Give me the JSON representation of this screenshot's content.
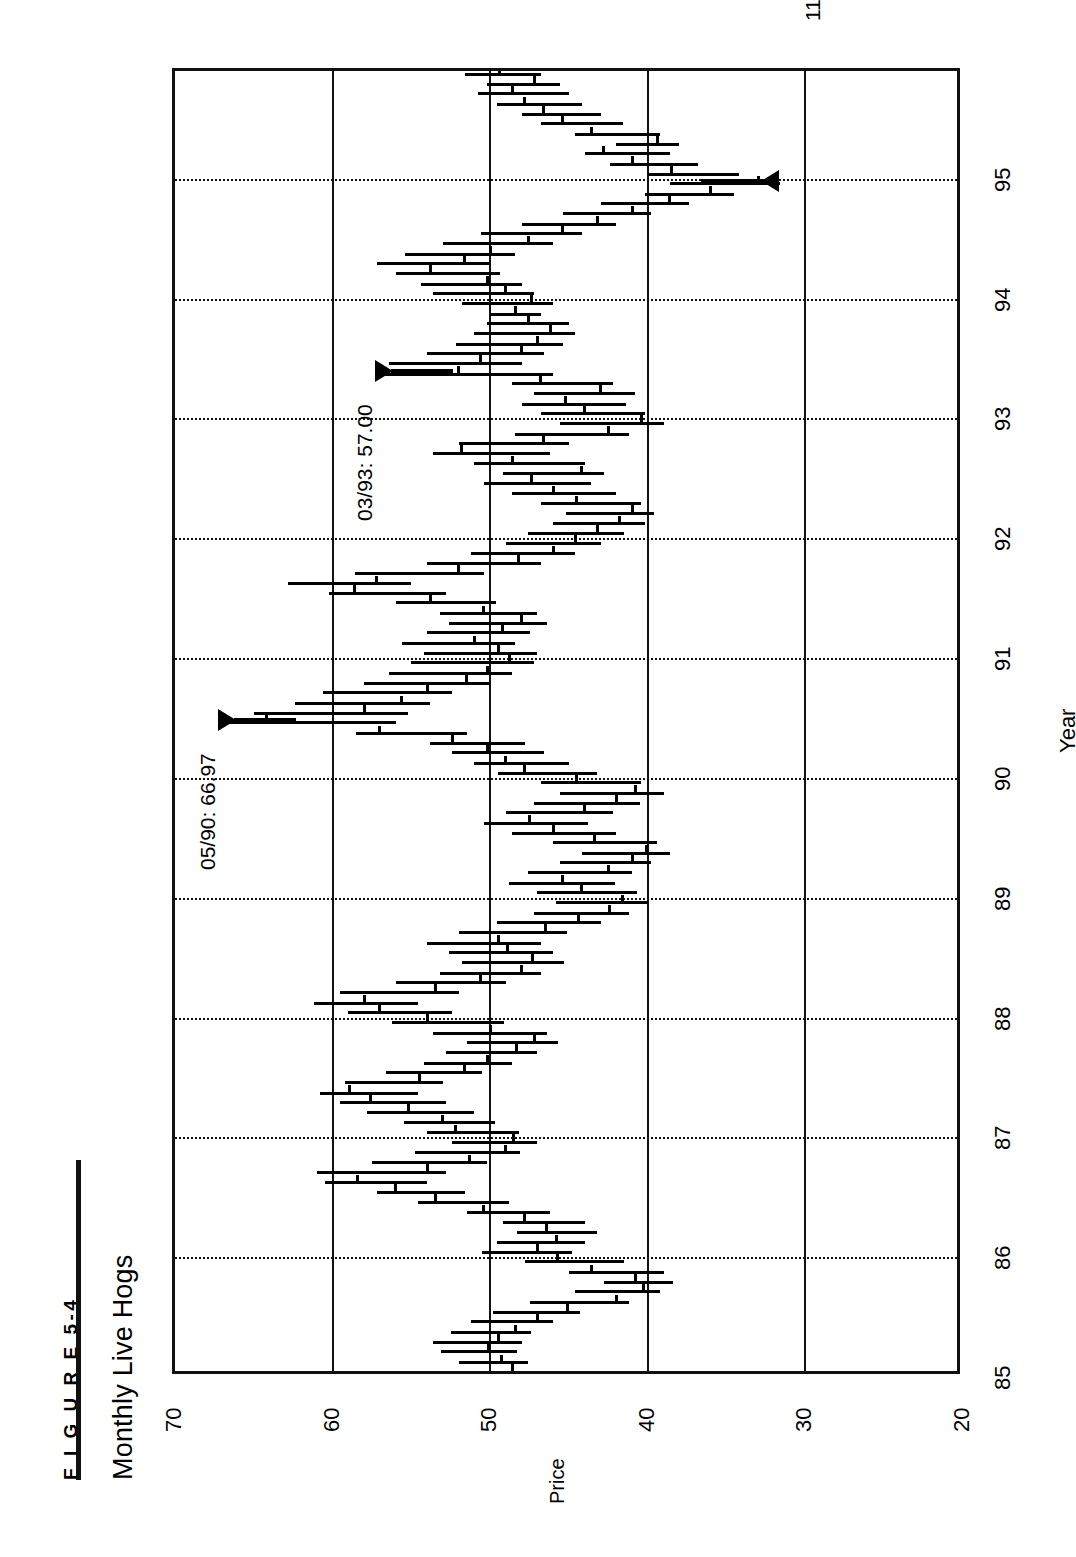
{
  "figure": {
    "label": "F I G U R E   5-4",
    "title": "Monthly Live Hogs"
  },
  "axes": {
    "price_axis_title": "Price",
    "year_axis_title": "Year",
    "price_ticks": [
      "70",
      "60",
      "50",
      "40",
      "30",
      "20"
    ],
    "price_min": 20,
    "price_max": 70,
    "year_ticks": [
      "85",
      "86",
      "87",
      "88",
      "89",
      "90",
      "91",
      "92",
      "93",
      "94",
      "95"
    ],
    "year_min": 1985.0,
    "year_max": 1995.9,
    "price_gridlines": [
      60,
      50,
      40,
      30
    ],
    "orientation": "rotated-90-cw"
  },
  "annotations": [
    {
      "name": "peak-1990",
      "label": "05/90: 66.97",
      "date": "05/90",
      "value": 66.97
    },
    {
      "name": "high-1993",
      "label": "03/93: 57.00",
      "date": "03/93",
      "value": 57.0
    },
    {
      "name": "low-1994",
      "label": "11/94: 31.60",
      "date": "11/94",
      "value": 31.6
    }
  ],
  "colors": {
    "ink": "#111111",
    "bar": "#000000",
    "background": "#ffffff"
  },
  "chart_data": {
    "type": "ohlc",
    "title": "Monthly Live Hogs",
    "xlabel": "Year",
    "ylabel": "Price",
    "xlim": [
      1985.0,
      1995.92
    ],
    "ylim": [
      20,
      70
    ],
    "grid": true,
    "legend": "none",
    "note": "Monthly high-low-close bars. Each entry: [decimal_year, high, low, close].",
    "columns": [
      "t",
      "high",
      "low",
      "close"
    ],
    "bars": [
      [
        1985.04,
        51.0,
        47.2,
        48.6
      ],
      [
        1985.12,
        52.0,
        47.6,
        49.3
      ],
      [
        1985.21,
        53.1,
        48.3,
        50.1
      ],
      [
        1985.29,
        53.6,
        48.0,
        49.5
      ],
      [
        1985.37,
        52.5,
        47.4,
        48.4
      ],
      [
        1985.46,
        51.2,
        46.0,
        47.0
      ],
      [
        1985.54,
        49.8,
        44.3,
        45.1
      ],
      [
        1985.62,
        47.5,
        41.2,
        42.0
      ],
      [
        1985.71,
        44.6,
        39.2,
        40.3
      ],
      [
        1985.79,
        42.8,
        38.4,
        40.8
      ],
      [
        1985.87,
        45.0,
        39.0,
        43.6
      ],
      [
        1985.96,
        47.8,
        41.5,
        45.7
      ],
      [
        1986.04,
        50.5,
        44.8,
        47.0
      ],
      [
        1986.12,
        49.6,
        44.0,
        45.8
      ],
      [
        1986.21,
        48.3,
        43.2,
        46.4
      ],
      [
        1986.29,
        49.2,
        44.0,
        47.8
      ],
      [
        1986.37,
        51.5,
        46.2,
        50.4
      ],
      [
        1986.46,
        54.6,
        48.8,
        53.5
      ],
      [
        1986.54,
        57.2,
        51.6,
        56.0
      ],
      [
        1986.62,
        60.5,
        54.0,
        58.4
      ],
      [
        1986.71,
        61.0,
        52.8,
        54.0
      ],
      [
        1986.79,
        57.5,
        50.2,
        51.3
      ],
      [
        1986.87,
        54.8,
        48.1,
        49.0
      ],
      [
        1986.96,
        52.4,
        47.0,
        48.5
      ],
      [
        1987.04,
        54.0,
        48.2,
        52.2
      ],
      [
        1987.12,
        55.5,
        49.7,
        53.0
      ],
      [
        1987.21,
        57.8,
        51.0,
        55.2
      ],
      [
        1987.29,
        59.5,
        52.8,
        57.6
      ],
      [
        1987.37,
        60.8,
        54.6,
        58.9
      ],
      [
        1987.46,
        59.2,
        53.0,
        54.5
      ],
      [
        1987.54,
        56.6,
        50.5,
        51.6
      ],
      [
        1987.62,
        54.2,
        48.6,
        50.2
      ],
      [
        1987.71,
        52.8,
        47.0,
        48.3
      ],
      [
        1987.79,
        51.5,
        45.7,
        47.2
      ],
      [
        1987.87,
        53.6,
        46.4,
        50.0
      ],
      [
        1987.96,
        56.2,
        49.1,
        54.0
      ],
      [
        1988.04,
        59.0,
        52.4,
        57.0
      ],
      [
        1988.12,
        61.2,
        54.6,
        58.0
      ],
      [
        1988.21,
        59.5,
        52.0,
        53.5
      ],
      [
        1988.29,
        56.0,
        49.0,
        50.6
      ],
      [
        1988.37,
        53.2,
        46.8,
        48.0
      ],
      [
        1988.46,
        51.8,
        45.3,
        47.3
      ],
      [
        1988.54,
        52.6,
        46.0,
        48.9
      ],
      [
        1988.62,
        54.0,
        46.8,
        49.5
      ],
      [
        1988.71,
        52.0,
        45.1,
        46.5
      ],
      [
        1988.79,
        49.6,
        43.0,
        44.4
      ],
      [
        1988.87,
        47.2,
        41.2,
        42.4
      ],
      [
        1988.96,
        45.8,
        40.0,
        41.6
      ],
      [
        1989.04,
        47.0,
        40.7,
        44.2
      ],
      [
        1989.12,
        48.8,
        42.1,
        45.4
      ],
      [
        1989.21,
        47.6,
        41.0,
        42.5
      ],
      [
        1989.29,
        45.6,
        39.8,
        41.0
      ],
      [
        1989.37,
        44.2,
        38.6,
        40.1
      ],
      [
        1989.46,
        46.0,
        39.4,
        43.4
      ],
      [
        1989.54,
        48.6,
        42.0,
        46.0
      ],
      [
        1989.62,
        50.4,
        43.8,
        47.5
      ],
      [
        1989.71,
        49.0,
        42.2,
        44.0
      ],
      [
        1989.79,
        47.2,
        40.5,
        42.0
      ],
      [
        1989.87,
        45.6,
        39.0,
        40.8
      ],
      [
        1989.96,
        46.8,
        40.4,
        44.5
      ],
      [
        1990.04,
        49.5,
        43.2,
        47.8
      ],
      [
        1990.12,
        51.0,
        45.0,
        49.0
      ],
      [
        1990.21,
        52.4,
        46.6,
        50.2
      ],
      [
        1990.29,
        53.8,
        47.8,
        52.4
      ],
      [
        1990.37,
        58.5,
        51.5,
        57.0
      ],
      [
        1990.46,
        66.97,
        56.0,
        64.2
      ],
      [
        1990.54,
        65.0,
        55.2,
        58.0
      ],
      [
        1990.62,
        62.4,
        53.8,
        55.6
      ],
      [
        1990.71,
        60.6,
        52.4,
        54.0
      ],
      [
        1990.79,
        58.0,
        50.0,
        51.5
      ],
      [
        1990.87,
        56.4,
        48.6,
        50.2
      ],
      [
        1990.96,
        55.0,
        47.2,
        48.8
      ],
      [
        1991.04,
        54.2,
        47.0,
        49.5
      ],
      [
        1991.12,
        55.6,
        48.4,
        51.0
      ],
      [
        1991.21,
        54.0,
        47.5,
        49.2
      ],
      [
        1991.29,
        52.6,
        46.4,
        48.0
      ],
      [
        1991.37,
        53.2,
        47.0,
        50.4
      ],
      [
        1991.46,
        56.0,
        49.6,
        53.8
      ],
      [
        1991.54,
        60.2,
        52.8,
        58.6
      ],
      [
        1991.62,
        62.8,
        55.0,
        57.2
      ],
      [
        1991.71,
        58.6,
        50.4,
        52.0
      ],
      [
        1991.79,
        54.0,
        46.8,
        48.2
      ],
      [
        1991.87,
        51.2,
        44.6,
        46.0
      ],
      [
        1991.96,
        49.0,
        43.0,
        44.6
      ],
      [
        1992.04,
        47.6,
        41.5,
        43.2
      ],
      [
        1992.12,
        46.0,
        40.2,
        41.8
      ],
      [
        1992.21,
        45.2,
        39.6,
        41.0
      ],
      [
        1992.29,
        46.8,
        40.4,
        44.5
      ],
      [
        1992.37,
        48.6,
        42.0,
        46.0
      ],
      [
        1992.46,
        50.4,
        43.6,
        47.4
      ],
      [
        1992.54,
        49.2,
        42.8,
        44.2
      ],
      [
        1992.62,
        51.0,
        44.0,
        48.6
      ],
      [
        1992.71,
        53.6,
        46.2,
        51.8
      ],
      [
        1992.79,
        52.0,
        45.0,
        46.6
      ],
      [
        1992.87,
        48.4,
        41.2,
        42.5
      ],
      [
        1992.96,
        45.6,
        39.0,
        40.4
      ],
      [
        1993.04,
        46.8,
        40.2,
        44.0
      ],
      [
        1993.12,
        48.0,
        41.4,
        45.2
      ],
      [
        1993.21,
        47.2,
        40.8,
        43.0
      ],
      [
        1993.29,
        48.6,
        42.2,
        46.8
      ],
      [
        1993.37,
        57.0,
        46.0,
        52.0
      ],
      [
        1993.46,
        56.4,
        48.0,
        50.6
      ],
      [
        1993.54,
        54.0,
        46.6,
        48.0
      ],
      [
        1993.62,
        52.2,
        45.4,
        47.0
      ],
      [
        1993.71,
        51.0,
        44.6,
        46.2
      ],
      [
        1993.79,
        50.2,
        45.0,
        47.6
      ],
      [
        1993.87,
        50.0,
        46.8,
        48.4
      ],
      [
        1993.96,
        51.8,
        46.0,
        47.4
      ],
      [
        1994.04,
        53.6,
        47.2,
        49.0
      ],
      [
        1994.12,
        54.4,
        48.0,
        50.2
      ],
      [
        1994.21,
        56.0,
        49.4,
        53.8
      ],
      [
        1994.29,
        57.2,
        50.0,
        51.6
      ],
      [
        1994.37,
        55.4,
        48.4,
        50.0
      ],
      [
        1994.46,
        53.0,
        46.0,
        47.6
      ],
      [
        1994.54,
        50.6,
        44.2,
        45.4
      ],
      [
        1994.62,
        48.0,
        42.0,
        43.2
      ],
      [
        1994.71,
        45.4,
        39.8,
        41.0
      ],
      [
        1994.79,
        43.0,
        37.4,
        38.6
      ],
      [
        1994.87,
        40.2,
        34.5,
        36.0
      ],
      [
        1994.96,
        38.6,
        31.6,
        33.0
      ],
      [
        1995.04,
        40.0,
        34.2,
        38.5
      ],
      [
        1995.12,
        42.4,
        36.8,
        41.0
      ],
      [
        1995.21,
        44.0,
        38.6,
        42.8
      ],
      [
        1995.29,
        42.0,
        38.0,
        39.4
      ],
      [
        1995.37,
        44.6,
        39.2,
        43.6
      ],
      [
        1995.46,
        46.8,
        41.6,
        45.4
      ],
      [
        1995.54,
        48.0,
        43.0,
        46.6
      ],
      [
        1995.62,
        49.6,
        44.2,
        47.8
      ],
      [
        1995.71,
        50.8,
        45.0,
        48.6
      ],
      [
        1995.79,
        50.2,
        45.6,
        47.2
      ],
      [
        1995.87,
        51.6,
        46.8,
        49.4
      ]
    ]
  }
}
